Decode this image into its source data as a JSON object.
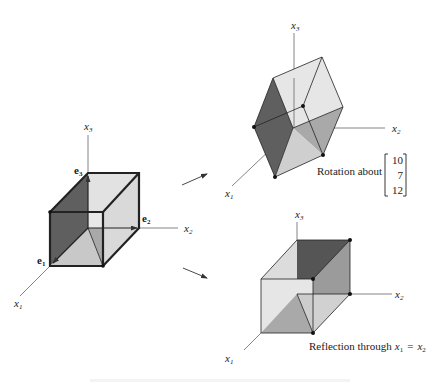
{
  "figure": {
    "left": {
      "axes": {
        "x1": "x",
        "x1_sub": "1",
        "x2": "x",
        "x2_sub": "2",
        "x3": "x",
        "x3_sub": "3"
      },
      "vectors": {
        "e1": "e",
        "e1_sub": "1",
        "e2": "e",
        "e2_sub": "2",
        "e3": "e",
        "e3_sub": "3"
      }
    },
    "top_right": {
      "axes": {
        "x1": "x",
        "x1_sub": "1",
        "x2": "x",
        "x2_sub": "2",
        "x3": "x",
        "x3_sub": "3"
      },
      "caption": "Rotation about",
      "rotation_vector": [
        "10",
        "7",
        "12"
      ]
    },
    "bottom_right": {
      "axes": {
        "x1": "x",
        "x1_sub": "1",
        "x2": "x",
        "x2_sub": "2",
        "x3": "x",
        "x3_sub": "3"
      },
      "caption_prefix": "Reflection through",
      "eq_lhs": "x",
      "eq_lhs_sub": "1",
      "eq_sign": "=",
      "eq_rhs": "x",
      "eq_rhs_sub": "2"
    },
    "colors": {
      "dark_face": "#5f5f5f",
      "mid_face": "#a9a9a9",
      "light_face": "#d4d4d4",
      "pale_face": "#e8e8e8",
      "edge": "#222222",
      "axis": "#777777"
    }
  }
}
